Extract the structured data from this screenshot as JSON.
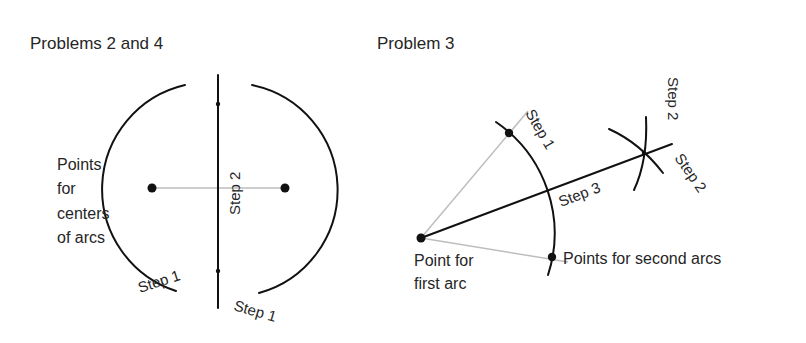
{
  "panels": [
    {
      "title": "Problems 2 and 4",
      "labels": {
        "points_label_lines": [
          "Points",
          "for",
          "centers",
          "of arcs"
        ],
        "step1_left": "Step 1",
        "step1_right": "Step 1",
        "step2": "Step 2"
      },
      "geometry": {
        "center_points": [
          [
            152,
            188
          ],
          [
            285,
            188
          ]
        ],
        "arc_intersections": [
          [
            218,
            104
          ],
          [
            218,
            271
          ]
        ],
        "arc_radius": 107,
        "bisector_x": 218,
        "bisector_y_range": [
          75,
          308
        ]
      }
    },
    {
      "title": "Problem 3",
      "labels": {
        "point_first_arc_lines": [
          "Point for",
          "first arc"
        ],
        "points_second_arcs": "Points for second arcs",
        "step1": "Step 1",
        "step2_top": "Step 2",
        "step2_right": "Step 2",
        "step3": "Step 3"
      },
      "geometry": {
        "vertex": [
          421,
          238
        ],
        "first_arc_radius": 135,
        "second_arc_points": [
          [
            509,
            133
          ],
          [
            552,
            257
          ]
        ],
        "bisector_end": [
          672,
          144
        ],
        "bisector_cross_point": [
          644,
          153
        ]
      }
    }
  ],
  "colors": {
    "ink": "#111111",
    "guide": "#bdbdbd",
    "text": "#262626",
    "background": "#ffffff"
  }
}
